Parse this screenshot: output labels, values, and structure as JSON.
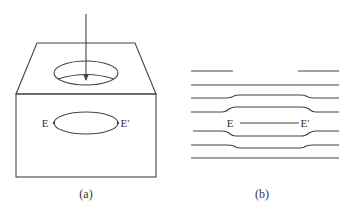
{
  "panel_a": {
    "caption": "(a)",
    "label_left": "E",
    "label_right": "E′",
    "elements": [
      "box (trapezoid top, rectangular front face)",
      "circular hole on top face",
      "downward arrow into hole",
      "closed loop from E to E′ on front face"
    ]
  },
  "panel_b": {
    "caption": "(b)",
    "label_left": "E",
    "label_right": "E′",
    "elements": [
      "seven horizontal lines",
      "top line broken with gap in middle",
      "middle lines bulge around a slit from E to E′"
    ]
  }
}
